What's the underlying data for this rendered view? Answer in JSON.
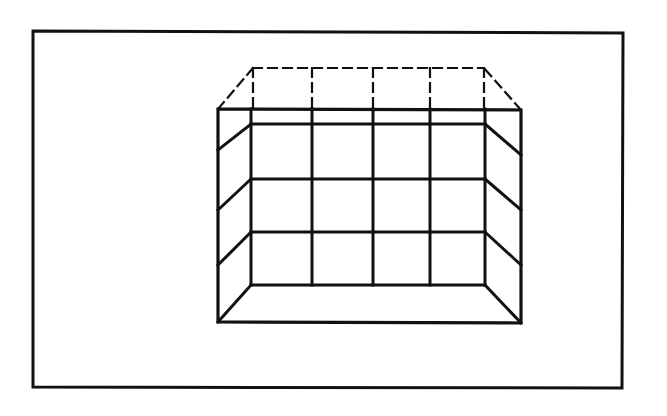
{
  "canvas": {
    "width": 667,
    "height": 416,
    "background": "#ffffff"
  },
  "colors": {
    "ink": "#111111"
  },
  "diagram": {
    "frame": {
      "points": [
        [
          33,
          31
        ],
        [
          623,
          33
        ],
        [
          622,
          388
        ],
        [
          33,
          387
        ]
      ],
      "stroke_width": 3
    },
    "front_face": {
      "top_left": [
        218,
        109
      ],
      "top_right": [
        521,
        110
      ],
      "bottom_right": [
        521,
        323
      ],
      "bottom_left": [
        218,
        322
      ],
      "stroke_width": 3.2
    },
    "back_wall": {
      "left": 251,
      "right": 485,
      "top": 124,
      "bottom": 285,
      "vertical_x": [
        251,
        312,
        373,
        430,
        485
      ],
      "vertical_top": 109,
      "horizontal_y": [
        124,
        179,
        232,
        285
      ],
      "stroke_width": 3
    },
    "left_side_diagonals": [
      {
        "from": [
          251,
          124
        ],
        "to": [
          218,
          150
        ]
      },
      {
        "from": [
          251,
          179
        ],
        "to": [
          218,
          210
        ]
      },
      {
        "from": [
          251,
          232
        ],
        "to": [
          218,
          265
        ]
      },
      {
        "from": [
          251,
          285
        ],
        "to": [
          218,
          322
        ]
      }
    ],
    "right_side_diagonals": [
      {
        "from": [
          485,
          124
        ],
        "to": [
          521,
          155
        ]
      },
      {
        "from": [
          485,
          179
        ],
        "to": [
          521,
          210
        ]
      },
      {
        "from": [
          485,
          232
        ],
        "to": [
          521,
          265
        ]
      },
      {
        "from": [
          485,
          285
        ],
        "to": [
          521,
          323
        ]
      }
    ],
    "hidden_top": {
      "back_left": [
        253,
        68
      ],
      "back_right": [
        484,
        68
      ],
      "front_left": [
        218,
        109
      ],
      "front_right": [
        521,
        110
      ],
      "vertical_x": [
        253,
        312,
        373,
        430,
        484
      ],
      "vertical_top": 68,
      "vertical_bottom": 109,
      "dash": "9 6",
      "stroke_width": 2.2
    }
  }
}
